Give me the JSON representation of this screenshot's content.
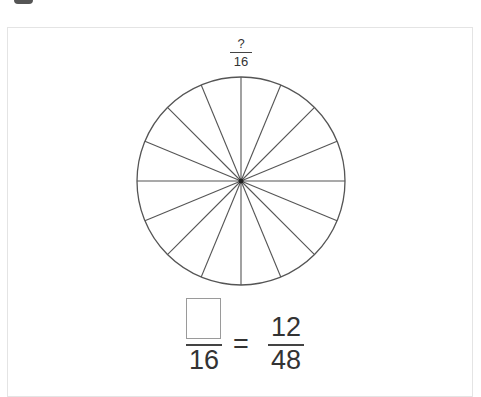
{
  "problem": {
    "wheel": {
      "total_parts": 16,
      "label_numerator": "?",
      "label_denominator": "16",
      "stroke_color": "#555555"
    },
    "equation": {
      "left_numerator": "",
      "left_denominator": "16",
      "operator": "=",
      "right_numerator": "12",
      "right_denominator": "48"
    }
  }
}
